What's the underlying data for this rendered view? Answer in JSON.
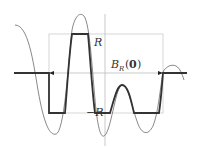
{
  "diagram": {
    "labels": {
      "top_level": "R",
      "bottom_level": "−R",
      "ball_label_main": "B",
      "ball_label_sub": "R",
      "ball_label_arg_open": "(",
      "ball_label_arg": "0",
      "ball_label_arg_close": ")"
    },
    "colors": {
      "curve": "#555555",
      "thick_curve": "#333333",
      "box": "#cccccc",
      "axis": "#bbbbbb"
    }
  }
}
